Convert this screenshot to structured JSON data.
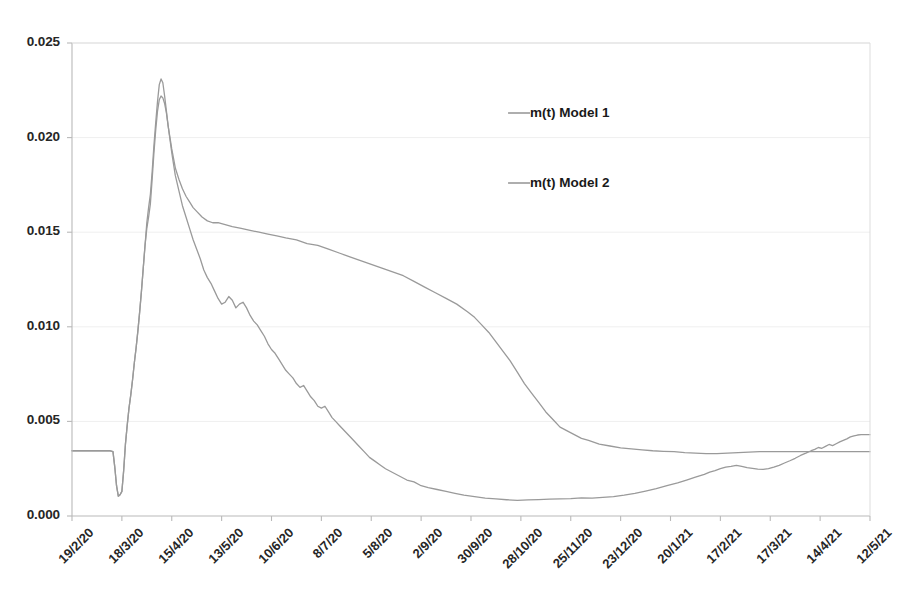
{
  "chart_data": {
    "type": "line",
    "title": "",
    "xlabel": "",
    "ylabel": "",
    "ylim": [
      0.0,
      0.025
    ],
    "ytick_values": [
      0.0,
      0.005,
      0.01,
      0.015,
      0.02,
      0.025
    ],
    "ytick_labels": [
      "0.000",
      "0.005",
      "0.010",
      "0.015",
      "0.020",
      "0.025"
    ],
    "grid": true,
    "grid_axis": "y",
    "legend_position": "inside-upper-center",
    "x_tick_labels": [
      "19/2/20",
      "18/3/20",
      "15/4/20",
      "13/5/20",
      "10/6/20",
      "8/7/20",
      "5/8/20",
      "2/9/20",
      "30/9/20",
      "28/10/20",
      "25/11/20",
      "23/12/20",
      "20/1/21",
      "17/2/21",
      "17/3/21",
      "14/4/21",
      "12/5/21"
    ],
    "x_tick_interval_days": 28,
    "x_range_days": [
      0,
      448
    ],
    "series": [
      {
        "name": "m(t) Model 1",
        "color": "#9a9a9a",
        "points": [
          [
            0,
            0.00345
          ],
          [
            8,
            0.00345
          ],
          [
            16,
            0.00345
          ],
          [
            21,
            0.00345
          ],
          [
            23,
            0.0034
          ],
          [
            24,
            0.0026
          ],
          [
            25,
            0.0016
          ],
          [
            26,
            0.00105
          ],
          [
            27,
            0.00112
          ],
          [
            28,
            0.0013
          ],
          [
            29,
            0.0024
          ],
          [
            30,
            0.0038
          ],
          [
            31,
            0.0048
          ],
          [
            32,
            0.0057
          ],
          [
            33,
            0.0064
          ],
          [
            34,
            0.0072
          ],
          [
            35,
            0.0081
          ],
          [
            36,
            0.0089
          ],
          [
            37,
            0.0098
          ],
          [
            38,
            0.0108
          ],
          [
            39,
            0.0119
          ],
          [
            40,
            0.0131
          ],
          [
            41,
            0.0143
          ],
          [
            42,
            0.0155
          ],
          [
            43,
            0.0163
          ],
          [
            44,
            0.017
          ],
          [
            45,
            0.0182
          ],
          [
            46,
            0.0196
          ],
          [
            47,
            0.0208
          ],
          [
            48,
            0.0219
          ],
          [
            49,
            0.0228
          ],
          [
            50,
            0.0231
          ],
          [
            51,
            0.0229
          ],
          [
            52,
            0.0222
          ],
          [
            53,
            0.0214
          ],
          [
            54,
            0.0206
          ],
          [
            55,
            0.02
          ],
          [
            56,
            0.0194
          ],
          [
            57,
            0.0189
          ],
          [
            58,
            0.0184
          ],
          [
            60,
            0.0178
          ],
          [
            62,
            0.0173
          ],
          [
            64,
            0.0169
          ],
          [
            66,
            0.0166
          ],
          [
            68,
            0.0163
          ],
          [
            70,
            0.0161
          ],
          [
            73,
            0.0158
          ],
          [
            76,
            0.0156
          ],
          [
            79,
            0.0155
          ],
          [
            82,
            0.0155
          ],
          [
            86,
            0.0154
          ],
          [
            90,
            0.0153
          ],
          [
            95,
            0.0152
          ],
          [
            100,
            0.0151
          ],
          [
            105,
            0.015
          ],
          [
            110,
            0.0149
          ],
          [
            115,
            0.0148
          ],
          [
            120,
            0.0147
          ],
          [
            126,
            0.0146
          ],
          [
            132,
            0.0144
          ],
          [
            138,
            0.0143
          ],
          [
            144,
            0.0141
          ],
          [
            150,
            0.0139
          ],
          [
            156,
            0.0137
          ],
          [
            162,
            0.0135
          ],
          [
            168,
            0.0133
          ],
          [
            174,
            0.0131
          ],
          [
            180,
            0.0129
          ],
          [
            186,
            0.0127
          ],
          [
            192,
            0.0124
          ],
          [
            198,
            0.0121
          ],
          [
            204,
            0.0118
          ],
          [
            210,
            0.0115
          ],
          [
            216,
            0.0112
          ],
          [
            222,
            0.0108
          ],
          [
            226,
            0.0105
          ],
          [
            230,
            0.0101
          ],
          [
            234,
            0.0097
          ],
          [
            238,
            0.0092
          ],
          [
            242,
            0.0087
          ],
          [
            246,
            0.0082
          ],
          [
            250,
            0.0076
          ],
          [
            254,
            0.007
          ],
          [
            258,
            0.0065
          ],
          [
            262,
            0.006
          ],
          [
            266,
            0.0055
          ],
          [
            270,
            0.0051
          ],
          [
            274,
            0.0047
          ],
          [
            278,
            0.0045
          ],
          [
            282,
            0.0043
          ],
          [
            286,
            0.0041
          ],
          [
            290,
            0.004
          ],
          [
            296,
            0.0038
          ],
          [
            302,
            0.0037
          ],
          [
            308,
            0.0036
          ],
          [
            314,
            0.00355
          ],
          [
            320,
            0.0035
          ],
          [
            326,
            0.00345
          ],
          [
            332,
            0.00342
          ],
          [
            338,
            0.0034
          ],
          [
            344,
            0.00335
          ],
          [
            350,
            0.00332
          ],
          [
            356,
            0.0033
          ],
          [
            362,
            0.0033
          ],
          [
            368,
            0.00332
          ],
          [
            374,
            0.00335
          ],
          [
            380,
            0.00338
          ],
          [
            386,
            0.0034
          ],
          [
            392,
            0.0034
          ],
          [
            400,
            0.0034
          ],
          [
            410,
            0.0034
          ],
          [
            420,
            0.0034
          ],
          [
            430,
            0.0034
          ],
          [
            440,
            0.0034
          ],
          [
            448,
            0.0034
          ]
        ]
      },
      {
        "name": "m(t) Model 2",
        "color": "#9a9a9a",
        "points": [
          [
            0,
            0.00345
          ],
          [
            8,
            0.00345
          ],
          [
            16,
            0.00345
          ],
          [
            21,
            0.00345
          ],
          [
            23,
            0.0034
          ],
          [
            24,
            0.0026
          ],
          [
            25,
            0.0016
          ],
          [
            26,
            0.00105
          ],
          [
            27,
            0.00112
          ],
          [
            28,
            0.0013
          ],
          [
            29,
            0.0024
          ],
          [
            30,
            0.0038
          ],
          [
            31,
            0.0048
          ],
          [
            32,
            0.0057
          ],
          [
            33,
            0.0064
          ],
          [
            34,
            0.0072
          ],
          [
            35,
            0.0081
          ],
          [
            36,
            0.0089
          ],
          [
            37,
            0.0098
          ],
          [
            38,
            0.0108
          ],
          [
            39,
            0.0119
          ],
          [
            40,
            0.0131
          ],
          [
            41,
            0.0143
          ],
          [
            42,
            0.0152
          ],
          [
            43,
            0.0158
          ],
          [
            44,
            0.0165
          ],
          [
            45,
            0.0178
          ],
          [
            46,
            0.0192
          ],
          [
            47,
            0.0204
          ],
          [
            48,
            0.0214
          ],
          [
            49,
            0.022
          ],
          [
            50,
            0.0222
          ],
          [
            51,
            0.0221
          ],
          [
            52,
            0.0218
          ],
          [
            53,
            0.0213
          ],
          [
            54,
            0.0206
          ],
          [
            55,
            0.0199
          ],
          [
            56,
            0.0192
          ],
          [
            57,
            0.0186
          ],
          [
            58,
            0.018
          ],
          [
            60,
            0.0172
          ],
          [
            62,
            0.0164
          ],
          [
            64,
            0.0158
          ],
          [
            66,
            0.0152
          ],
          [
            68,
            0.0146
          ],
          [
            70,
            0.0141
          ],
          [
            72,
            0.0136
          ],
          [
            74,
            0.013
          ],
          [
            76,
            0.0126
          ],
          [
            78,
            0.0123
          ],
          [
            80,
            0.0119
          ],
          [
            82,
            0.0115
          ],
          [
            84,
            0.0112
          ],
          [
            86,
            0.0113
          ],
          [
            88,
            0.0116
          ],
          [
            90,
            0.0114
          ],
          [
            92,
            0.011
          ],
          [
            94,
            0.0112
          ],
          [
            96,
            0.0113
          ],
          [
            98,
            0.011
          ],
          [
            100,
            0.0106
          ],
          [
            102,
            0.0103
          ],
          [
            104,
            0.0101
          ],
          [
            106,
            0.0098
          ],
          [
            108,
            0.0095
          ],
          [
            110,
            0.0091
          ],
          [
            112,
            0.0088
          ],
          [
            114,
            0.0086
          ],
          [
            116,
            0.0083
          ],
          [
            118,
            0.008
          ],
          [
            120,
            0.0077
          ],
          [
            122,
            0.0075
          ],
          [
            124,
            0.0073
          ],
          [
            126,
            0.007
          ],
          [
            128,
            0.0068
          ],
          [
            130,
            0.0069
          ],
          [
            132,
            0.0066
          ],
          [
            134,
            0.0063
          ],
          [
            136,
            0.0061
          ],
          [
            138,
            0.0058
          ],
          [
            140,
            0.0057
          ],
          [
            142,
            0.0058
          ],
          [
            144,
            0.0055
          ],
          [
            146,
            0.0052
          ],
          [
            148,
            0.005
          ],
          [
            150,
            0.0048
          ],
          [
            152,
            0.0046
          ],
          [
            154,
            0.0044
          ],
          [
            156,
            0.0042
          ],
          [
            158,
            0.004
          ],
          [
            161,
            0.0037
          ],
          [
            164,
            0.0034
          ],
          [
            167,
            0.0031
          ],
          [
            170,
            0.0029
          ],
          [
            173,
            0.0027
          ],
          [
            176,
            0.0025
          ],
          [
            180,
            0.0023
          ],
          [
            184,
            0.0021
          ],
          [
            188,
            0.0019
          ],
          [
            192,
            0.0018
          ],
          [
            196,
            0.0016
          ],
          [
            200,
            0.0015
          ],
          [
            205,
            0.0014
          ],
          [
            210,
            0.0013
          ],
          [
            215,
            0.0012
          ],
          [
            220,
            0.0011
          ],
          [
            226,
            0.00102
          ],
          [
            232,
            0.00095
          ],
          [
            238,
            0.0009
          ],
          [
            244,
            0.00086
          ],
          [
            250,
            0.00083
          ],
          [
            256,
            0.00085
          ],
          [
            262,
            0.00087
          ],
          [
            268,
            0.00089
          ],
          [
            274,
            0.0009
          ],
          [
            280,
            0.00092
          ],
          [
            286,
            0.00096
          ],
          [
            292,
            0.00095
          ],
          [
            298,
            0.00098
          ],
          [
            304,
            0.00102
          ],
          [
            310,
            0.0011
          ],
          [
            316,
            0.0012
          ],
          [
            322,
            0.00132
          ],
          [
            328,
            0.00145
          ],
          [
            334,
            0.0016
          ],
          [
            340,
            0.00175
          ],
          [
            345,
            0.0019
          ],
          [
            350,
            0.00205
          ],
          [
            355,
            0.0022
          ],
          [
            358,
            0.00232
          ],
          [
            361,
            0.0024
          ],
          [
            364,
            0.0025
          ],
          [
            367,
            0.00258
          ],
          [
            370,
            0.00262
          ],
          [
            373,
            0.00268
          ],
          [
            376,
            0.00262
          ],
          [
            379,
            0.00256
          ],
          [
            382,
            0.00252
          ],
          [
            385,
            0.00248
          ],
          [
            388,
            0.00246
          ],
          [
            391,
            0.0025
          ],
          [
            394,
            0.00258
          ],
          [
            397,
            0.00268
          ],
          [
            400,
            0.0028
          ],
          [
            403,
            0.00292
          ],
          [
            406,
            0.00305
          ],
          [
            409,
            0.0032
          ],
          [
            412,
            0.00332
          ],
          [
            415,
            0.00345
          ],
          [
            417,
            0.00352
          ],
          [
            419,
            0.00362
          ],
          [
            421,
            0.00358
          ],
          [
            423,
            0.00368
          ],
          [
            425,
            0.00378
          ],
          [
            427,
            0.00372
          ],
          [
            429,
            0.00382
          ],
          [
            431,
            0.00392
          ],
          [
            433,
            0.004
          ],
          [
            435,
            0.00408
          ],
          [
            437,
            0.00418
          ],
          [
            439,
            0.00424
          ],
          [
            441,
            0.00428
          ],
          [
            443,
            0.0043
          ],
          [
            445,
            0.0043
          ],
          [
            448,
            0.0043
          ]
        ]
      }
    ],
    "legend": [
      {
        "label": "m(t) Model 1",
        "color": "#9a9a9a"
      },
      {
        "label": "m(t) Model 2",
        "color": "#9a9a9a"
      }
    ]
  },
  "axes": {
    "plot_left": 72,
    "plot_right": 870,
    "plot_top": 43,
    "plot_bottom": 516,
    "axis_color": "#c8c8c8",
    "grid_color": "#efefef"
  }
}
